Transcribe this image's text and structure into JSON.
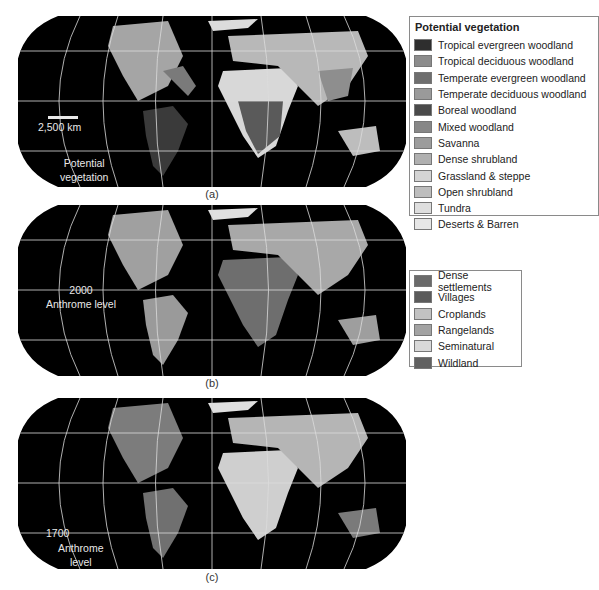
{
  "panels": [
    {
      "id": "a",
      "caption": "(a)",
      "map_label_lines": [
        "Potential",
        "vegetation"
      ],
      "scale_bar_label": "2,500 km",
      "land_tone": "#9a9a9a"
    },
    {
      "id": "b",
      "caption": "(b)",
      "map_label_lines": [
        "2000",
        "Anthrome level"
      ],
      "land_tone": "#8e8e8e"
    },
    {
      "id": "c",
      "caption": "(c)",
      "map_label_lines": [
        "1700",
        "Anthrome",
        "level"
      ],
      "land_tone": "#7a7a7a"
    }
  ],
  "legend_vegetation": {
    "title": "Potential vegetation",
    "items": [
      {
        "label": "Tropical evergreen woodland",
        "color": "#2e2e2e"
      },
      {
        "label": "Tropical deciduous woodland",
        "color": "#8c8c8c"
      },
      {
        "label": "Temperate evergreen woodland",
        "color": "#6e6e6e"
      },
      {
        "label": "Temperate deciduous woodland",
        "color": "#9a9a9a"
      },
      {
        "label": "Boreal woodland",
        "color": "#4a4a4a"
      },
      {
        "label": "Mixed woodland",
        "color": "#878787"
      },
      {
        "label": "Savanna",
        "color": "#9c9c9c"
      },
      {
        "label": "Dense shrubland",
        "color": "#b0b0b0"
      },
      {
        "label": "Grassland & steppe",
        "color": "#d4d4d4"
      },
      {
        "label": "Open shrubland",
        "color": "#bdbdbd"
      },
      {
        "label": "Tundra",
        "color": "#dedede"
      },
      {
        "label": "Deserts & Barren",
        "color": "#e6e6e6"
      }
    ]
  },
  "legend_anthrome": {
    "items": [
      {
        "label": "Dense settlements",
        "color": "#6a6a6a"
      },
      {
        "label": "Villages",
        "color": "#5a5a5a"
      },
      {
        "label": "Croplands",
        "color": "#c2c2c2"
      },
      {
        "label": "Rangelands",
        "color": "#a3a3a3"
      },
      {
        "label": "Seminatural",
        "color": "#d9d9d9"
      },
      {
        "label": "Wildland",
        "color": "#616161"
      }
    ]
  }
}
